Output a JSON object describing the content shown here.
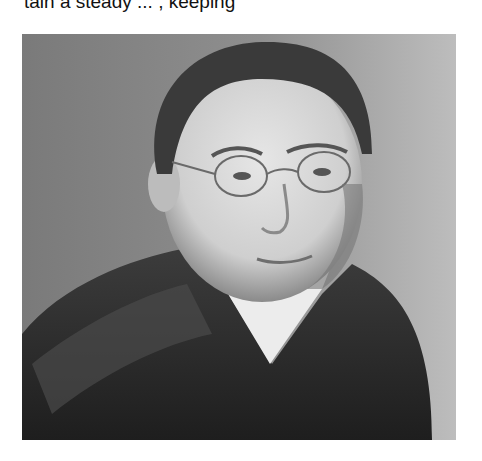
{
  "page": {
    "clipped_text_line": "tain a steady ... , keeping"
  },
  "figure": {
    "colors": {
      "background_gray": "#8e8e8e",
      "background_light": "#b8b8b8",
      "jacket": "#2e2e2e",
      "face": "#d9d9d9",
      "hair": "#3a3a3a",
      "collar": "#eeeeee"
    }
  }
}
